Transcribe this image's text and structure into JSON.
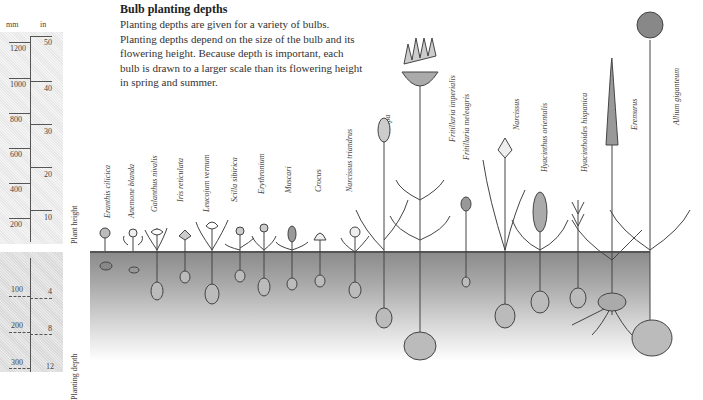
{
  "title": "Bulb planting depths",
  "description": "Planting depths are given for a variety of bulbs. Planting depths depend on the size of the bulb and its flowering height. Because depth is important, each bulb is drawn to a larger scale than its flowering height in spring and summer.",
  "scale": {
    "unit_left": "mm",
    "unit_right": "in",
    "height_label": "Plant height",
    "depth_label": "Planting depth",
    "height_mm": [
      "1200",
      "1000",
      "800",
      "600",
      "400",
      "200"
    ],
    "height_in": [
      "50",
      "40",
      "30",
      "20",
      "10"
    ],
    "depth_mm": [
      "100",
      "200",
      "300"
    ],
    "depth_in": [
      "4",
      "8",
      "12"
    ]
  },
  "plants": [
    {
      "name": "Eranthis cilicica"
    },
    {
      "name": "Anemone blanda"
    },
    {
      "name": "Galanthus nivalis"
    },
    {
      "name": "Iris reticulata"
    },
    {
      "name": "Leucojum vernum"
    },
    {
      "name": "Scilla sibirica"
    },
    {
      "name": "Erythronium"
    },
    {
      "name": "Muscari"
    },
    {
      "name": "Crocus"
    },
    {
      "name": "Narcissus triandrus"
    },
    {
      "name": "Tulipa"
    },
    {
      "name": "Fritillaria imperialis"
    },
    {
      "name": "Fritillaria meleagris"
    },
    {
      "name": "Narcissus"
    },
    {
      "name": "Hyacinthus orientalis"
    },
    {
      "name": "Hyacinthoides hispanica"
    },
    {
      "name": "Eremurus"
    },
    {
      "name": "Allium giganteum"
    }
  ]
}
